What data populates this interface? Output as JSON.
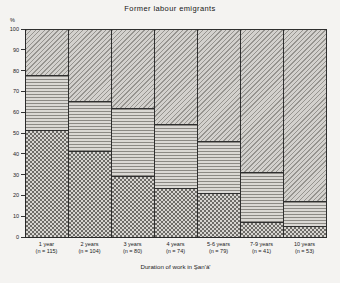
{
  "figure": {
    "title": "Former labour emigrants",
    "x_axis_title": "Duration of work in Şan'ā'",
    "y_axis_unit": "%"
  },
  "colors": {
    "background": "#f4f3f1",
    "line": "#2f2f2f",
    "pattern_dark": "#6e6c68",
    "pattern_light": "#d7d5d1"
  },
  "chart_data": {
    "type": "bar",
    "subtype": "stacked-percentage-mosaic",
    "title": "Former labour emigrants",
    "xlabel": "Duration of work in Şan'ā'",
    "ylabel": "%",
    "ylim": [
      0,
      100
    ],
    "y_ticks": [
      0,
      10,
      20,
      30,
      40,
      50,
      60,
      70,
      80,
      90,
      100
    ],
    "grid": false,
    "legend": "none",
    "categories": [
      "1 year",
      "2 years",
      "3 years",
      "4 years",
      "5-6 years",
      "7-9 years",
      "10 years"
    ],
    "category_sublabels": [
      "(n = 115)",
      "(n = 104)",
      "(n = 80)",
      "(n = 74)",
      "(n = 79)",
      "(n = 41)",
      "(n = 53)"
    ],
    "series": [
      {
        "name": "bottom-segment",
        "pattern": "checkerboard",
        "values": [
          51,
          41,
          29,
          23,
          21,
          7,
          5
        ]
      },
      {
        "name": "middle-segment",
        "pattern": "horizontal-lines",
        "values": [
          27,
          24,
          33,
          31,
          25,
          24,
          12
        ]
      },
      {
        "name": "top-segment",
        "pattern": "diagonal-hatch",
        "values": [
          22,
          35,
          38,
          46,
          54,
          69,
          83
        ]
      }
    ]
  }
}
